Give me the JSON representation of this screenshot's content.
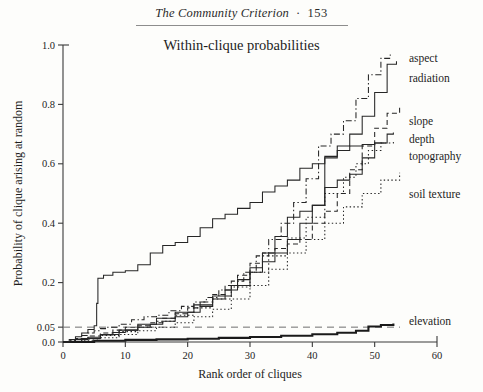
{
  "page": {
    "running_head": "The Community Criterion",
    "separator": "·",
    "page_number": "153"
  },
  "chart_data": {
    "type": "line",
    "title": "Within-clique probabilities",
    "xlabel": "Rank order of cliques",
    "ylabel": "Probability of clique arising at random",
    "xlim": [
      0,
      60
    ],
    "ylim": [
      0,
      1.0
    ],
    "xticks": [
      "0",
      "10",
      "20",
      "30",
      "40",
      "50",
      "60"
    ],
    "xtick_values": [
      0,
      10,
      20,
      30,
      40,
      50,
      60
    ],
    "yticks": [
      "0.0",
      "0.05",
      "0.2",
      "0.4",
      "0.6",
      "0.8",
      "1.0"
    ],
    "ytick_values": [
      0.0,
      0.05,
      0.2,
      0.4,
      0.6,
      0.8,
      1.0
    ],
    "grid": false,
    "legend_position": "right-inline-annotations",
    "annotations": [
      {
        "text": "significance threshold",
        "y": 0.05,
        "style": "dashed-horizontal-line",
        "shown": false
      }
    ],
    "threshold_line": {
      "value": 0.05,
      "style": "dashed"
    },
    "series": [
      {
        "name": "aspect",
        "label": "aspect",
        "style": "dashdot",
        "label_x": 55.5,
        "label_y": 0.955,
        "x": [
          0,
          1,
          2,
          3,
          4,
          5,
          6,
          7,
          9,
          11,
          13,
          15,
          17,
          19,
          21,
          23,
          25,
          27,
          29,
          31,
          33,
          35,
          37,
          39,
          41,
          43,
          45,
          47,
          49,
          51,
          52.5
        ],
        "y": [
          0.0,
          0.005,
          0.012,
          0.022,
          0.03,
          0.038,
          0.045,
          0.05,
          0.06,
          0.075,
          0.085,
          0.09,
          0.105,
          0.12,
          0.135,
          0.15,
          0.175,
          0.205,
          0.235,
          0.29,
          0.345,
          0.4,
          0.47,
          0.55,
          0.66,
          0.7,
          0.745,
          0.82,
          0.9,
          0.955,
          0.975
        ]
      },
      {
        "name": "radiation",
        "label": "radiation",
        "style": "solid",
        "label_x": 55.5,
        "label_y": 0.89,
        "x": [
          0,
          2,
          4,
          6,
          8,
          10,
          12,
          14,
          16,
          18,
          20,
          22,
          24,
          26,
          28,
          30,
          32,
          34,
          36,
          38,
          40,
          42,
          44,
          46,
          48,
          50,
          52,
          53.5
        ],
        "y": [
          0.0,
          0.008,
          0.016,
          0.024,
          0.032,
          0.04,
          0.05,
          0.06,
          0.07,
          0.085,
          0.1,
          0.12,
          0.145,
          0.175,
          0.21,
          0.25,
          0.3,
          0.355,
          0.42,
          0.44,
          0.46,
          0.62,
          0.66,
          0.7,
          0.76,
          0.84,
          0.935,
          0.945
        ]
      },
      {
        "name": "slope",
        "label": "slope",
        "style": "dashed",
        "label_x": 55.5,
        "label_y": 0.745,
        "x": [
          0,
          2,
          4,
          6,
          8,
          10,
          12,
          14,
          16,
          18,
          20,
          22,
          24,
          26,
          28,
          30,
          32,
          34,
          36,
          38,
          40,
          42,
          44,
          46,
          48,
          50,
          52,
          54
        ],
        "y": [
          0.0,
          0.01,
          0.02,
          0.03,
          0.04,
          0.05,
          0.055,
          0.065,
          0.08,
          0.095,
          0.115,
          0.135,
          0.16,
          0.19,
          0.225,
          0.265,
          0.3,
          0.315,
          0.33,
          0.345,
          0.4,
          0.44,
          0.5,
          0.58,
          0.66,
          0.72,
          0.77,
          0.795
        ]
      },
      {
        "name": "depth",
        "label": "depth",
        "style": "solid",
        "label_x": 55.5,
        "label_y": 0.685,
        "x": [
          0,
          3,
          6,
          9,
          12,
          15,
          18,
          21,
          24,
          27,
          30,
          32,
          34,
          36,
          38,
          40,
          42,
          44,
          46,
          48,
          50,
          52,
          53
        ],
        "y": [
          0.0,
          0.012,
          0.025,
          0.04,
          0.06,
          0.08,
          0.1,
          0.125,
          0.155,
          0.19,
          0.235,
          0.27,
          0.3,
          0.345,
          0.4,
          0.46,
          0.52,
          0.545,
          0.565,
          0.62,
          0.67,
          0.7,
          0.705
        ]
      },
      {
        "name": "topography",
        "label": "topography",
        "style": "dotted",
        "label_x": 55.5,
        "label_y": 0.625,
        "x": [
          0,
          3,
          6,
          9,
          12,
          15,
          18,
          21,
          24,
          27,
          30,
          33,
          36,
          39,
          42,
          45,
          47,
          49,
          51,
          53
        ],
        "y": [
          0.0,
          0.01,
          0.022,
          0.035,
          0.05,
          0.07,
          0.09,
          0.115,
          0.145,
          0.185,
          0.235,
          0.29,
          0.35,
          0.42,
          0.5,
          0.555,
          0.6,
          0.645,
          0.67,
          0.68
        ]
      },
      {
        "name": "soil texture",
        "label": "soil texture",
        "style": "dotted2",
        "label_x": 55.5,
        "label_y": 0.5,
        "x": [
          0,
          3,
          6,
          9,
          12,
          15,
          18,
          21,
          24,
          27,
          30,
          33,
          36,
          39,
          42,
          45,
          48,
          51,
          54
        ],
        "y": [
          0.0,
          0.006,
          0.014,
          0.025,
          0.038,
          0.05,
          0.065,
          0.085,
          0.11,
          0.145,
          0.19,
          0.245,
          0.3,
          0.345,
          0.4,
          0.455,
          0.5,
          0.545,
          0.57
        ]
      },
      {
        "name": "elevation",
        "label": "elevation",
        "style": "solid-thick",
        "label_x": 55.5,
        "label_y": 0.072,
        "x": [
          0,
          5,
          10,
          15,
          20,
          25,
          30,
          35,
          40,
          44,
          47,
          49,
          51,
          53
        ],
        "y": [
          0.0,
          0.004,
          0.007,
          0.009,
          0.011,
          0.014,
          0.017,
          0.021,
          0.026,
          0.031,
          0.038,
          0.052,
          0.057,
          0.062
        ]
      },
      {
        "name": "early-riser-solid",
        "label": "",
        "style": "solid",
        "label_x": null,
        "label_y": null,
        "x": [
          0,
          1,
          2,
          3,
          4,
          5,
          5.4,
          5.6,
          6.5,
          8,
          10,
          12,
          14,
          16,
          18,
          20,
          22,
          24,
          26,
          28,
          30,
          32,
          34,
          36,
          38,
          40,
          42,
          44,
          46,
          48,
          50,
          51.5
        ],
        "y": [
          0.0,
          0.008,
          0.018,
          0.03,
          0.042,
          0.055,
          0.13,
          0.215,
          0.225,
          0.235,
          0.24,
          0.26,
          0.3,
          0.325,
          0.335,
          0.355,
          0.385,
          0.415,
          0.43,
          0.45,
          0.47,
          0.505,
          0.525,
          0.545,
          0.585,
          0.6,
          0.625,
          0.645,
          0.66,
          0.665,
          0.67,
          0.672
        ]
      }
    ]
  }
}
